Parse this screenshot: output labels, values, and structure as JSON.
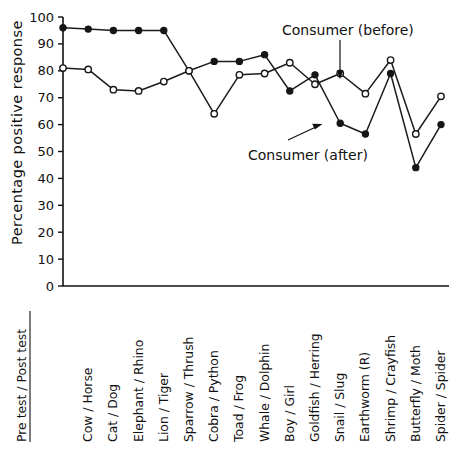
{
  "chart_data": {
    "type": "line",
    "title": "",
    "xlabel": "",
    "ylabel": "Percentage positive response",
    "ylim": [
      0,
      100
    ],
    "yticks": [
      0,
      10,
      20,
      30,
      40,
      50,
      60,
      70,
      80,
      90,
      100
    ],
    "grid": false,
    "legend_position": "inline-annotations",
    "axis_header": "Pre test / Post test",
    "categories": [
      "Cow / Horse",
      "Cat / Dog",
      "Elephant / Rhino",
      "Lion / Tiger",
      "Sparrow / Thrush",
      "Cobra / Python",
      "Toad / Frog",
      "Whale / Dolphin",
      "Boy / Girl",
      "Goldfish / Herring",
      "Snail / Slug",
      "Earthworm (R)",
      "Shrimp / Crayfish",
      "Butterfly / Moth",
      "Spider / Spider"
    ],
    "series": [
      {
        "name": "Consumer (before)",
        "marker": "filled-circle",
        "start_value": 96,
        "values": [
          95.5,
          95,
          95,
          95,
          80,
          83.5,
          83.5,
          86,
          72.5,
          78.5,
          60.5,
          56.5,
          79,
          44,
          60
        ]
      },
      {
        "name": "Consumer (after)",
        "marker": "open-circle",
        "start_value": 81,
        "values": [
          80.5,
          73,
          72.5,
          76,
          80,
          64,
          78.5,
          79,
          83,
          75,
          79,
          71.5,
          84,
          56.5,
          70.5
        ]
      }
    ],
    "annotations": [
      {
        "text": "Consumer (before)"
      },
      {
        "text": "Consumer (after)"
      }
    ]
  }
}
